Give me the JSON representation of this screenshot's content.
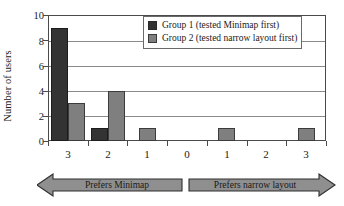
{
  "chart_data": {
    "type": "bar",
    "title": "",
    "xlabel": "",
    "ylabel": "Number of users",
    "categories": [
      "3",
      "2",
      "1",
      "0",
      "1",
      "2",
      "3"
    ],
    "series": [
      {
        "name": "Group 1 (tested Minimap first)",
        "color": "#333333",
        "values": [
          9,
          1,
          0,
          0,
          0,
          0,
          0
        ]
      },
      {
        "name": "Group 2 (tested narrow layout first)",
        "color": "#7f7f7f",
        "values": [
          3,
          4,
          1,
          0,
          1,
          0,
          1
        ]
      }
    ],
    "ylim": [
      0,
      10
    ],
    "yticks": [
      "0",
      "2",
      "4",
      "6",
      "8",
      "10"
    ],
    "grid": true,
    "legend_position": "top-right"
  },
  "legend": {
    "items": [
      {
        "label": "Group 1 (tested Minimap first)",
        "color": "#333333"
      },
      {
        "label": "Group 2 (tested narrow layout first)",
        "color": "#7f7f7f"
      }
    ]
  },
  "axis": {
    "y_title": "Number of users"
  },
  "preference_bands": [
    {
      "label": "Prefers Minimap",
      "direction": "left"
    },
    {
      "label": "Prefers narrow layout",
      "direction": "right"
    }
  ]
}
